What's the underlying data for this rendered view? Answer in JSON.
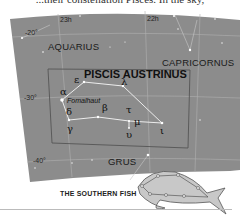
{
  "page": {
    "top_text": "...their constellation Pisces. In the sky,",
    "caption": "THE SOUTHERN FISH"
  },
  "chart": {
    "title": "PISCIS AUSTRINUS",
    "ra_labels": [
      "23h",
      "22h"
    ],
    "dec_labels": [
      "-20°",
      "-30°",
      "-40°"
    ],
    "constellations": [
      "AQUARIUS",
      "CAPRICORNUS",
      "GRUS"
    ],
    "greek_labels": {
      "alpha": "α",
      "epsilon": "ε",
      "lambda": "λ",
      "delta": "δ",
      "beta": "β",
      "tau": "τ",
      "mu": "μ",
      "gamma": "γ",
      "upsilon": "υ",
      "iota": "ι"
    },
    "star_name": "Fomalhaut",
    "colors": {
      "sky": "#8a8a8a",
      "grid": "#b5b5b5",
      "box": "#555555",
      "lines": "#e8e8e8",
      "fish_fill": "#c8c8c8"
    }
  }
}
